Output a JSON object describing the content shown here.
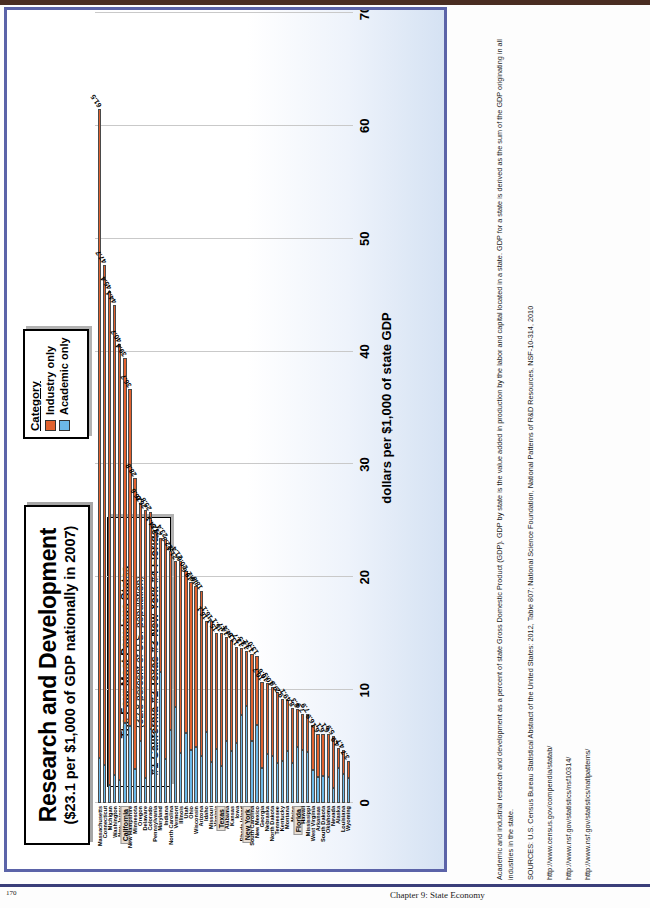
{
  "slide": {
    "title_main": "Research and Development",
    "title_sub": "($23.1 per $1,000 of GDP nationally in 2007)",
    "callout": {
      "line1": "The Four Most Populous States",
      "line2": "(32.8 percent of U.S. population)",
      "line3": "#1 California  #2 Texas  #3 New York  #4 Florida"
    },
    "legend": {
      "title": "Category",
      "items": [
        {
          "label": "Industry only",
          "color": "#e1622f"
        },
        {
          "label": "Academic only",
          "color": "#6cb8e8"
        }
      ]
    }
  },
  "footer": {
    "note": "Academic and industrial research and development as a percent of state Gross Domestic Product (GDP). GDP by state is the value added in production by the labor and capital located in a state. GDP for a state is derived as the sum of the GDP originating in all industries in the state.",
    "sources": "SOURCES: U.S. Census Bureau Statistical Abstract of the United States: 2012, Table 807; National Science Foundation, National Patterns of R&D Resources, NSF-10-314, 2010",
    "links": [
      "http://www.census.gov/compendia/statab/",
      "http://www.nsf.gov/statistics/nsf10314/",
      "http://www.nsf.gov/statistics/natlpatterns/"
    ]
  },
  "page": {
    "number": "170",
    "chapter": "Chapter 9: State Economy"
  },
  "chart_data": {
    "type": "bar",
    "orientation": "vertical-columns",
    "title": "Research and Development",
    "subtitle": "($23.1 per $1,000 of GDP nationally in 2007)",
    "xlabel": "",
    "ylabel": "dollars per $1,000 of state GDP",
    "ylim": [
      0,
      70
    ],
    "yticks": [
      0,
      10,
      20,
      30,
      40,
      50,
      60,
      70
    ],
    "grid": true,
    "legend_position": "top-right",
    "stacked": true,
    "series": [
      {
        "name": "Academic only",
        "color": "#6cb8e8"
      },
      {
        "name": "Industry only",
        "color": "#e1622f"
      }
    ],
    "highlighted_categories": [
      "California",
      "Texas",
      "New York",
      "Florida"
    ],
    "categories": [
      "Massachusetts",
      "Connecticut",
      "Michigan",
      "Washington",
      "New Jersey",
      "California",
      "New Hampshire",
      "Minnesota",
      "Oregon",
      "Delaware",
      "Colorado",
      "Pennsylvania",
      "Maryland",
      "Indiana",
      "North Carolina",
      "Vermont",
      "Illinois",
      "Utah",
      "Ohio",
      "Wisconsin",
      "Arizona",
      "Idaho",
      "Missouri",
      "Virginia",
      "Texas",
      "Alabama",
      "Kansas",
      "Iowa",
      "Rhode Island",
      "New York",
      "South Carolina",
      "New Mexico",
      "Georgia",
      "Nebraska",
      "North Dakota",
      "Tennessee",
      "Kentucky",
      "Montana",
      "Maine",
      "Florida",
      "Hawaii",
      "Mississippi",
      "West Virginia",
      "Arkansas",
      "South Dakota",
      "Oklahoma",
      "Nevada",
      "Alaska",
      "Louisiana",
      "Wyoming"
    ],
    "values": [
      61.5,
      47.7,
      45.4,
      44.1,
      40.7,
      39.4,
      36.7,
      28.8,
      26.6,
      26.0,
      25.8,
      24.1,
      23.5,
      23.4,
      22.3,
      21.4,
      21.4,
      20.6,
      19.6,
      19.2,
      18.8,
      16.1,
      16.1,
      15.1,
      15.1,
      14.7,
      14.4,
      13.8,
      13.7,
      13.5,
      13.2,
      13.0,
      10.7,
      10.6,
      10.3,
      9.8,
      9.2,
      9.1,
      8.4,
      8.3,
      7.9,
      7.9,
      6.9,
      6.1,
      6.1,
      6.1,
      5.9,
      4.9,
      4.7,
      3.7
    ],
    "academic_only": [
      4.0,
      3.4,
      1.6,
      2.5,
      2.0,
      7.1,
      6.8,
      3.0,
      5.5,
      2.2,
      6.6,
      6.3,
      11.6,
      3.9,
      6.5,
      8.5,
      4.4,
      6.2,
      4.7,
      5.0,
      4.2,
      6.3,
      3.6,
      4.8,
      3.3,
      5.5,
      4.6,
      5.3,
      7.8,
      8.6,
      5.5,
      6.9,
      3.1,
      4.3,
      4.2,
      3.5,
      3.7,
      4.6,
      3.5,
      5.0,
      4.7,
      4.5,
      2.9,
      2.3,
      2.4,
      2.3,
      1.3,
      3.1,
      2.6,
      2.2
    ],
    "industry_only": [
      57.5,
      44.3,
      43.8,
      41.6,
      38.7,
      32.3,
      29.9,
      25.8,
      21.1,
      23.8,
      19.2,
      17.8,
      11.9,
      19.5,
      15.8,
      12.9,
      17.0,
      14.4,
      14.9,
      14.2,
      14.6,
      9.8,
      12.5,
      10.3,
      11.8,
      9.2,
      9.8,
      8.5,
      5.9,
      4.9,
      7.7,
      6.1,
      7.6,
      6.3,
      6.1,
      6.3,
      5.5,
      4.5,
      4.9,
      3.3,
      3.2,
      3.4,
      4.0,
      3.8,
      3.7,
      3.8,
      4.6,
      1.8,
      2.1,
      1.5
    ]
  }
}
